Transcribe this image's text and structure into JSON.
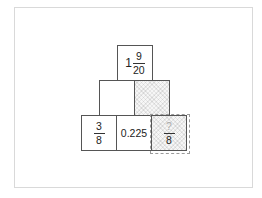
{
  "pyramid": {
    "top": {
      "whole": "1",
      "numerator": "9",
      "denominator": "20"
    },
    "middle": [
      {
        "value": "",
        "shaded": false
      },
      {
        "value": "",
        "shaded": true
      }
    ],
    "bottom": [
      {
        "type": "fraction",
        "numerator": "3",
        "denominator": "8"
      },
      {
        "type": "decimal",
        "value": "0.225"
      },
      {
        "type": "fraction",
        "numerator": "?",
        "denominator": "8",
        "highlighted": true
      }
    ]
  },
  "colors": {
    "border": "#555555",
    "hatch": "#f6f6f6",
    "placeholder": "#aaaaaa",
    "highlight_border": "#9a9a9a"
  }
}
